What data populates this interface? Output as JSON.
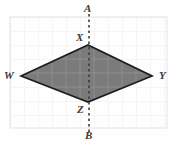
{
  "figure": {
    "type": "geometry-diagram",
    "colors": {
      "background": "#fefefe",
      "grid_line": "#ebebeb",
      "grid_border": "#e2e2e2",
      "shape_fill": "#7b7b7b",
      "shape_stroke": "#1c1c1c",
      "shape_inner_grid": "#8e8e8e",
      "dashed_line": "#3d3d3d",
      "label_text": "#3a3a3a"
    },
    "grid": {
      "left": 10,
      "top": 17,
      "right": 167,
      "bottom": 128,
      "cell_size": 14,
      "columns": 11,
      "rows": 8
    },
    "dashed_line": {
      "name": "AB",
      "x": 89,
      "y_top": 14,
      "y_bottom": 136,
      "dash": "2.5 3",
      "width": 1.6
    },
    "shape": {
      "name": "rhombus-WXYZ",
      "points": "21,76 88,45 152,76 88,102",
      "vertices": [
        {
          "label": "W",
          "x": 21,
          "y": 76
        },
        {
          "label": "X",
          "x": 88,
          "y": 45
        },
        {
          "label": "Y",
          "x": 152,
          "y": 76
        },
        {
          "label": "Z",
          "x": 88,
          "y": 102
        }
      ]
    },
    "labels": [
      {
        "id": "A",
        "text": "A",
        "left": 84,
        "top": 3
      },
      {
        "id": "X",
        "text": "X",
        "left": 76,
        "top": 32
      },
      {
        "id": "W",
        "text": "W",
        "left": 4,
        "top": 70
      },
      {
        "id": "Y",
        "text": "Y",
        "left": 159,
        "top": 70
      },
      {
        "id": "Z",
        "text": "Z",
        "left": 77,
        "top": 104
      },
      {
        "id": "B",
        "text": "B",
        "left": 85,
        "top": 130
      }
    ]
  }
}
